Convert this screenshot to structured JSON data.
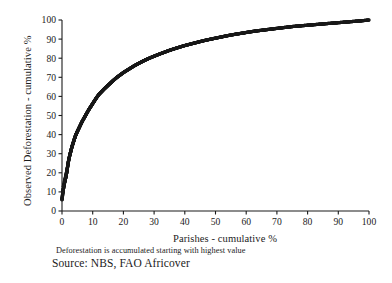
{
  "chart_data": {
    "type": "scatter",
    "title": "",
    "subtitle": "",
    "xlabel": "Parishes - cumulative %",
    "ylabel": "Observed Deforestation - cumulative %",
    "xlim": [
      0,
      100
    ],
    "ylim": [
      0,
      100
    ],
    "xticks": [
      0,
      10,
      20,
      30,
      40,
      50,
      60,
      70,
      80,
      90,
      100
    ],
    "yticks": [
      0,
      10,
      20,
      30,
      40,
      50,
      60,
      70,
      80,
      90,
      100
    ],
    "xtick_labels": [
      "0",
      "10",
      "20",
      "30",
      "40",
      "50",
      "60",
      "70",
      "80",
      "90",
      "100"
    ],
    "ytick_labels": [
      "0",
      "10",
      "20",
      "30",
      "40",
      "50",
      "60",
      "70",
      "80",
      "90",
      "100"
    ],
    "grid": false,
    "legend": false,
    "marker": "filled-circle",
    "marker_color": "#1a1a1a",
    "series": [
      {
        "name": "Cumulative deforestation by parish",
        "x": [
          0.0,
          0.3,
          0.6,
          0.9,
          1.2,
          1.5,
          1.8,
          2.1,
          2.5,
          2.9,
          3.3,
          3.8,
          4.3,
          4.8,
          5.4,
          6.0,
          6.6,
          7.3,
          8.0,
          8.7,
          9.5,
          10.3,
          11.1,
          12.0,
          12.9,
          13.8,
          14.8,
          15.8,
          16.8,
          17.9,
          19.0,
          20.1,
          21.3,
          22.5,
          23.7,
          25.0,
          26.3,
          27.6,
          29.0,
          30.4,
          31.8,
          33.3,
          34.8,
          36.3,
          37.9,
          39.5,
          41.1,
          42.8,
          44.5,
          46.2,
          47.9,
          49.7,
          51.5,
          53.3,
          55.2,
          57.1,
          59.0,
          60.9,
          62.9,
          64.9,
          66.9,
          68.9,
          71.0,
          73.1,
          75.2,
          77.3,
          79.5,
          81.7,
          83.9,
          86.1,
          88.4,
          90.7,
          93.0,
          95.3,
          97.6,
          100.0
        ],
        "y": [
          6.0,
          10.0,
          13.0,
          15.5,
          17.5,
          20.0,
          23.0,
          26.0,
          29.0,
          31.5,
          34.0,
          36.5,
          39.0,
          41.0,
          43.0,
          45.0,
          47.0,
          49.0,
          51.0,
          53.0,
          55.0,
          57.0,
          59.0,
          61.0,
          62.5,
          64.0,
          65.5,
          67.0,
          68.5,
          70.0,
          71.3,
          72.6,
          73.8,
          75.0,
          76.2,
          77.3,
          78.4,
          79.4,
          80.4,
          81.3,
          82.2,
          83.1,
          84.0,
          84.8,
          85.6,
          86.4,
          87.1,
          87.8,
          88.5,
          89.2,
          89.8,
          90.4,
          91.0,
          91.6,
          92.2,
          92.7,
          93.2,
          93.7,
          94.2,
          94.6,
          95.0,
          95.4,
          95.8,
          96.2,
          96.6,
          96.9,
          97.2,
          97.5,
          97.8,
          98.1,
          98.4,
          98.7,
          99.0,
          99.3,
          99.6,
          100.0
        ]
      }
    ],
    "annotations": [
      "Deforestation is accumulated starting with highest value",
      "Source: NBS, FAO Africover"
    ]
  },
  "captions": {
    "note": "Deforestation is accumulated starting with highest value",
    "source": "Source: NBS, FAO Africover"
  },
  "colors": {
    "background": "#ffffff",
    "axis": "#1a1a1a",
    "marker": "#1a1a1a",
    "text": "#1b1b1b"
  }
}
